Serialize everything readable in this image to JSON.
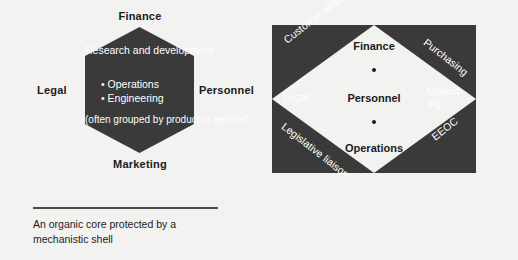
{
  "figure": {
    "background": "#f2f2f0",
    "dark_fill": "#3a3a3a",
    "text_dark": "#1b1b1b",
    "text_light": "#ffffff"
  },
  "left_diagram": {
    "shape": "hexagon",
    "outer_labels": {
      "top": "Finance",
      "left": "Legal",
      "right": "Personnel",
      "bottom": "Marketing"
    },
    "inner_text": {
      "heading": "Research and development",
      "bullets": "• Operations\n• Engineering",
      "note": "(often grouped by product or service)"
    },
    "caption": "An organic core protected by a mechanistic shell"
  },
  "right_diagram": {
    "shape": "square-with-diamond",
    "core_labels": {
      "top": "Finance",
      "middle": "Personnel",
      "bottom": "Operations"
    },
    "shell_labels": {
      "top_left": "Customer affairs",
      "top_right": "Purchasing",
      "left": "Legal",
      "right": "Market-\ning",
      "bottom_left": "Legislative liaison",
      "bottom_right": "EEOC"
    },
    "caption": "A mechanistic core wrapped by an organic shell"
  }
}
